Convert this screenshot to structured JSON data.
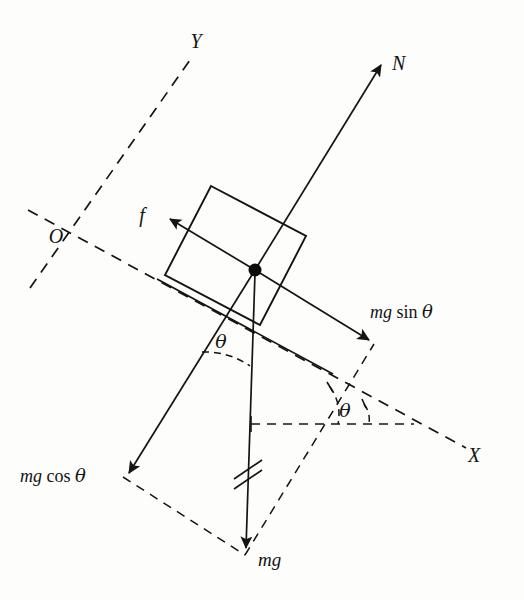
{
  "figure": {
    "background_color": "#fdfdfc",
    "ink_color": "#141414"
  },
  "axes": [
    {
      "name": "y-axis",
      "label": "Y",
      "style": "dashed",
      "label_position": {
        "x": 196,
        "y": 48
      }
    },
    {
      "name": "x-axis",
      "label": "X",
      "style": "dashed",
      "label_position": {
        "x": 474,
        "y": 462
      }
    },
    {
      "name": "origin",
      "label": "O",
      "style": "point",
      "label_position": {
        "x": 56,
        "y": 243
      }
    }
  ],
  "vectors": [
    {
      "name": "normal-force",
      "label": "N",
      "label_position": {
        "x": 392,
        "y": 70
      },
      "style": "solid",
      "tail": {
        "x": 255,
        "y": 270
      },
      "tip": {
        "x": 383,
        "y": 62
      }
    },
    {
      "name": "friction-force",
      "label": "f",
      "label_position": {
        "x": 142,
        "y": 222
      },
      "style": "solid",
      "tail": {
        "x": 255,
        "y": 270
      },
      "tip": {
        "x": 164,
        "y": 216
      }
    },
    {
      "name": "mg-sin-theta-component",
      "label": "mg sin θ",
      "label_parts": {
        "mg": "mg",
        "fn": "sin",
        "angle": "θ"
      },
      "label_position": {
        "x": 370,
        "y": 318
      },
      "style": "solid",
      "tail": {
        "x": 255,
        "y": 270
      },
      "tip": {
        "x": 374,
        "y": 344
      }
    },
    {
      "name": "mg-cos-theta-component",
      "label": "mg cos θ",
      "label_parts": {
        "mg": "mg",
        "fn": "cos",
        "angle": "θ"
      },
      "label_position": {
        "x": 20,
        "y": 482
      },
      "style": "solid",
      "tail": {
        "x": 255,
        "y": 270
      },
      "tip": {
        "x": 123,
        "y": 477
      }
    },
    {
      "name": "weight-force",
      "label": "mg",
      "label_position": {
        "x": 258,
        "y": 566
      },
      "style": "solid",
      "tail": {
        "x": 255,
        "y": 270
      },
      "tip": {
        "x": 245,
        "y": 555
      }
    }
  ],
  "angles": [
    {
      "name": "incline-angle-at-block",
      "label": "θ",
      "label_position": {
        "x": 221,
        "y": 348
      }
    },
    {
      "name": "incline-angle-at-base",
      "label": "θ",
      "label_position": {
        "x": 345,
        "y": 417
      }
    }
  ],
  "shapes": [
    {
      "name": "block",
      "kind": "rectangle",
      "style": "solid",
      "corners": [
        {
          "x": 211,
          "y": 186
        },
        {
          "x": 306,
          "y": 236
        },
        {
          "x": 260,
          "y": 325
        },
        {
          "x": 165,
          "y": 275
        }
      ]
    },
    {
      "name": "incline-surface",
      "kind": "line",
      "style": "solid",
      "from": {
        "x": 158,
        "y": 280
      },
      "to": {
        "x": 330,
        "y": 372
      }
    },
    {
      "name": "force-parallelogram",
      "kind": "quadrilateral",
      "style": "dashed",
      "corners": [
        {
          "x": 255,
          "y": 270
        },
        {
          "x": 123,
          "y": 477
        },
        {
          "x": 245,
          "y": 555
        },
        {
          "x": 374,
          "y": 344
        }
      ]
    },
    {
      "name": "parallel-hatch-marks",
      "kind": "tick-pair",
      "position": {
        "x": 247,
        "y": 480
      }
    },
    {
      "name": "center-of-mass-dot",
      "kind": "dot",
      "position": {
        "x": 255,
        "y": 270
      },
      "radius": 6.5
    },
    {
      "name": "horizontal-reference",
      "kind": "line",
      "style": "dashed",
      "from": {
        "x": 251,
        "y": 424
      },
      "to": {
        "x": 412,
        "y": 424
      }
    }
  ]
}
